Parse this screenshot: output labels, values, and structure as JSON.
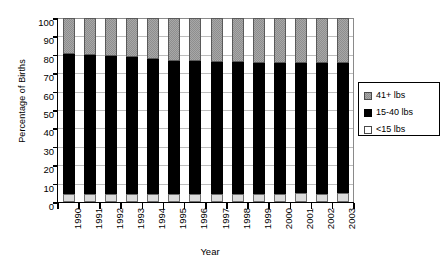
{
  "chart_data": {
    "type": "bar",
    "subtype": "stacked-100-percent",
    "title": "",
    "xlabel": "Year",
    "ylabel": "Percentage of Births",
    "ylim": [
      0,
      100
    ],
    "ytick_step": 10,
    "ytick_labels": [
      "100",
      "90",
      "80",
      "70",
      "60",
      "50",
      "40",
      "30",
      "20",
      "10",
      "0"
    ],
    "grid": true,
    "grid_axis": "y",
    "legend_position": "right",
    "categories": [
      "1990",
      "1991",
      "1992",
      "1993",
      "1994",
      "1995",
      "1996",
      "1997",
      "1998",
      "1999",
      "2000",
      "2001",
      "2002",
      "2003"
    ],
    "series": [
      {
        "name": "<15 lbs",
        "color": "#dcdcdc",
        "stack_order": 0,
        "values": [
          4.5,
          4.3,
          4.3,
          4.6,
          4.2,
          4.1,
          4.4,
          4.5,
          4.3,
          4.6,
          4.4,
          5.0,
          4.6,
          4.8
        ]
      },
      {
        "name": "15-40 lbs",
        "color": "#000000",
        "stack_order": 1,
        "values": [
          76.0,
          75.4,
          75.3,
          74.1,
          73.7,
          72.8,
          72.3,
          71.8,
          71.6,
          71.1,
          71.0,
          70.6,
          70.8,
          70.7
        ]
      },
      {
        "name": "41+ lbs",
        "color": "#a8a8a8",
        "stack_order": 2,
        "values": [
          19.5,
          20.3,
          20.4,
          21.3,
          22.1,
          23.1,
          23.3,
          23.7,
          24.1,
          24.3,
          24.6,
          24.4,
          24.6,
          24.5
        ]
      }
    ],
    "cumulative_tops": {
      "note": "top of black (<15 + 15-40) per year",
      "values": [
        80.5,
        79.7,
        79.6,
        78.7,
        77.9,
        76.9,
        76.7,
        76.3,
        75.9,
        75.7,
        75.4,
        75.6,
        75.4,
        75.5
      ]
    }
  },
  "legend": {
    "items": [
      {
        "label": "41+ lbs",
        "swatch": "gray-dither"
      },
      {
        "label": "15-40 lbs",
        "swatch": "black"
      },
      {
        "label": "<15 lbs",
        "swatch": "white"
      }
    ]
  },
  "colors": {
    "top_segment": "#a8a8a8",
    "mid_segment": "#000000",
    "bottom_segment": "#dcdcdc",
    "gridline": "#bdbdbd",
    "axis": "#000000",
    "background": "#ffffff"
  }
}
